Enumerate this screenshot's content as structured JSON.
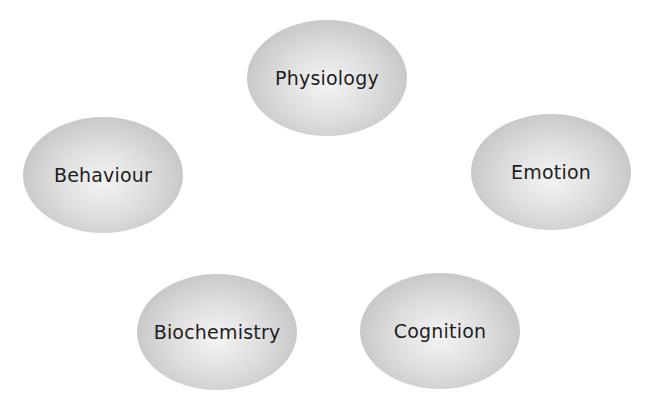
{
  "diagram": {
    "type": "concept-cluster",
    "nodes": [
      {
        "id": "physiology",
        "label": "Physiology"
      },
      {
        "id": "behaviour",
        "label": "Behaviour"
      },
      {
        "id": "emotion",
        "label": "Emotion"
      },
      {
        "id": "biochemistry",
        "label": "Biochemistry"
      },
      {
        "id": "cognition",
        "label": "Cognition"
      }
    ],
    "colors": {
      "node_center": "#f4f4f4",
      "node_edge": "#b8b8b8",
      "text": "#1e1e1e",
      "background": "#ffffff"
    }
  }
}
